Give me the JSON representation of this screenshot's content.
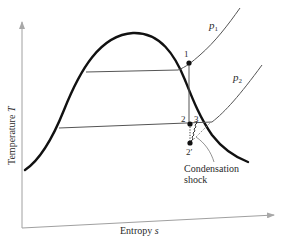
{
  "diagram": {
    "type": "T-s diagram",
    "axes": {
      "x_label": "Entropy",
      "x_symbol": "s",
      "y_label": "Temperature",
      "y_symbol": "T"
    },
    "isobars": [
      {
        "id": "p1",
        "label": "p",
        "subscript": "1"
      },
      {
        "id": "p2",
        "label": "p",
        "subscript": "2"
      }
    ],
    "states": [
      {
        "id": "1",
        "label": "1"
      },
      {
        "id": "2",
        "label": "2"
      },
      {
        "id": "3",
        "label": "3"
      },
      {
        "id": "2prime",
        "label": "2′"
      }
    ],
    "annotation": {
      "line1": "Condensation",
      "line2": "shock"
    },
    "colors": {
      "dome": "#111111",
      "thin_lines": "#555555",
      "axes": "#9a9a9a",
      "text": "#2a2a2a"
    }
  }
}
